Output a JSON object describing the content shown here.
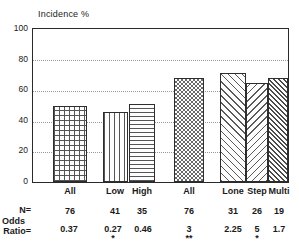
{
  "chart_data": {
    "type": "bar",
    "title": "Incidence %",
    "xlabel": "",
    "ylabel": "Incidence %",
    "ylim": [
      0,
      100
    ],
    "yticks": [
      0,
      20,
      40,
      60,
      80,
      100
    ],
    "grid": true,
    "legend": false,
    "categories": [
      "All",
      "Low",
      "High",
      "All",
      "Lone",
      "Step",
      "Multi"
    ],
    "values": [
      50,
      46,
      51,
      68,
      71,
      65,
      68
    ],
    "patterns": [
      "cross-hatch",
      "vertical-lines",
      "horizontal-lines",
      "checkerboard",
      "diagonal-forward",
      "diagonal-backward",
      "diagonal-forward-dense"
    ],
    "annotations": {
      "n_row_label": "N=",
      "odds_row_label_line1": "Odds",
      "odds_row_label_line2": "Ratio=",
      "n_values": [
        "76",
        "41",
        "35",
        "76",
        "31",
        "26",
        "19"
      ],
      "odds_ratios": [
        "0.37",
        "0.27",
        "0.46",
        "3",
        "2.25",
        "5",
        "1.7"
      ],
      "significance": [
        "",
        "*",
        "",
        "**",
        "",
        "*",
        ""
      ]
    },
    "groups": [
      {
        "name": "group-left",
        "bar_indices": [
          0,
          1,
          2
        ]
      },
      {
        "name": "group-right",
        "bar_indices": [
          3,
          4,
          5,
          6
        ]
      }
    ]
  },
  "colors": {
    "axis": "#2a2a2a",
    "grid": "#9a9a9a",
    "text": "#1a1a1a",
    "background": "#ffffff",
    "hatch": "#555555"
  }
}
